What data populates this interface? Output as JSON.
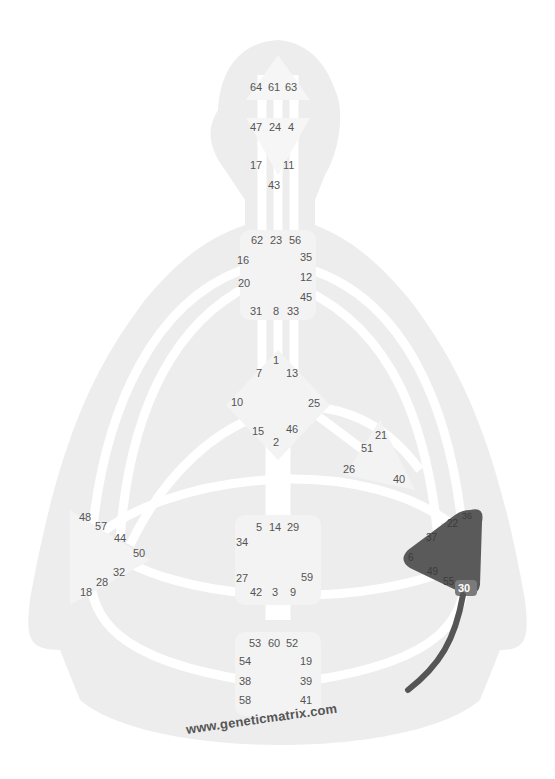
{
  "diagram": {
    "type": "human-design-bodygraph",
    "watermark": "www.geneticmatrix.com",
    "colors": {
      "silhouette": "#ececec",
      "channel": "#ffffff",
      "center_undefined": "#f4f4f4",
      "center_defined": "#5a5a5a",
      "gate_text": "#555555",
      "highlight_gate_bg": "#7a7a7a",
      "active_channel": "#555555"
    },
    "centers": {
      "head": {
        "defined": false,
        "gates": [
          "64",
          "61",
          "63"
        ]
      },
      "ajna": {
        "defined": false,
        "gates": [
          "47",
          "24",
          "4",
          "17",
          "11",
          "43"
        ]
      },
      "throat": {
        "defined": false,
        "gates": [
          "62",
          "23",
          "56",
          "16",
          "35",
          "12",
          "20",
          "45",
          "31",
          "8",
          "33"
        ]
      },
      "g": {
        "defined": false,
        "gates": [
          "1",
          "7",
          "13",
          "10",
          "25",
          "15",
          "46",
          "2"
        ]
      },
      "heart": {
        "defined": false,
        "gates": [
          "21",
          "51",
          "26",
          "40"
        ]
      },
      "spleen": {
        "defined": false,
        "gates": [
          "48",
          "57",
          "44",
          "50",
          "32",
          "28",
          "18"
        ]
      },
      "sacral": {
        "defined": false,
        "gates": [
          "5",
          "14",
          "29",
          "34",
          "27",
          "59",
          "42",
          "3",
          "9"
        ]
      },
      "solar_plexus": {
        "defined": true,
        "gates": [
          "36",
          "22",
          "37",
          "6",
          "49",
          "55",
          "30"
        ],
        "highlighted_gate": "30"
      },
      "root": {
        "defined": false,
        "gates": [
          "53",
          "60",
          "52",
          "54",
          "19",
          "38",
          "39",
          "58",
          "41"
        ]
      }
    },
    "active_channel_from_gate": "30"
  },
  "labels": {
    "g64": "64",
    "g61": "61",
    "g63": "63",
    "g47": "47",
    "g24": "24",
    "g4": "4",
    "g17": "17",
    "g11": "11",
    "g43": "43",
    "g62": "62",
    "g23": "23",
    "g56": "56",
    "g16": "16",
    "g35": "35",
    "g12": "12",
    "g20": "20",
    "g45": "45",
    "g31": "31",
    "g8": "8",
    "g33": "33",
    "g1": "1",
    "g7": "7",
    "g13": "13",
    "g10": "10",
    "g25": "25",
    "g15": "15",
    "g46": "46",
    "g2": "2",
    "g21": "21",
    "g51": "51",
    "g26": "26",
    "g40": "40",
    "g48": "48",
    "g57": "57",
    "g44": "44",
    "g50": "50",
    "g32": "32",
    "g28": "28",
    "g18": "18",
    "g5": "5",
    "g14": "14",
    "g29": "29",
    "g34": "34",
    "g27": "27",
    "g59": "59",
    "g42": "42",
    "g3": "3",
    "g9": "9",
    "g36": "36",
    "g22": "22",
    "g37": "37",
    "g6": "6",
    "g49": "49",
    "g55": "55",
    "g30": "30",
    "g53": "53",
    "g60": "60",
    "g52": "52",
    "g54": "54",
    "g19": "19",
    "g38": "38",
    "g39": "39",
    "g58": "58",
    "g41": "41"
  }
}
